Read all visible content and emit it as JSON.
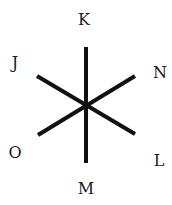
{
  "diagram": {
    "type": "six-ray star",
    "center": [
      86,
      105
    ],
    "stroke_color": "#111111",
    "stroke_width": 4,
    "lines": [
      {
        "id": "K-M",
        "x1": 86,
        "y1": 47,
        "x2": 86,
        "y2": 163
      },
      {
        "id": "J-L",
        "x1": 37,
        "y1": 76,
        "x2": 135,
        "y2": 134
      },
      {
        "id": "N-O",
        "x1": 135,
        "y1": 76,
        "x2": 38,
        "y2": 135
      }
    ],
    "labels": [
      {
        "id": "K",
        "text": "K",
        "x": 84,
        "y": 25
      },
      {
        "id": "N",
        "text": "N",
        "x": 160,
        "y": 78
      },
      {
        "id": "L",
        "text": "L",
        "x": 159,
        "y": 166
      },
      {
        "id": "M",
        "text": "M",
        "x": 86,
        "y": 194
      },
      {
        "id": "O",
        "text": "O",
        "x": 15,
        "y": 158
      },
      {
        "id": "J",
        "text": "J",
        "x": 15,
        "y": 68
      }
    ]
  }
}
